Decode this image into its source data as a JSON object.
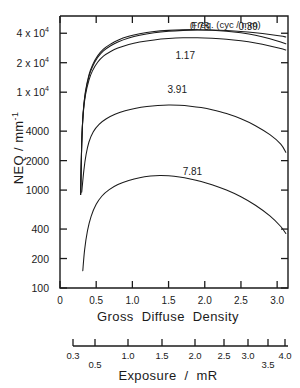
{
  "chart_data": {
    "type": "line",
    "title": "",
    "xlabel": "Gross  Diffuse  Density",
    "ylabel": "NEQ / mm⁻¹",
    "xlim": [
      0,
      3.15
    ],
    "ylim": [
      100,
      60000
    ],
    "yscale": "log",
    "grid": false,
    "legend_position": "top-right-inline",
    "legend_title": "Freq. (cyc / mm)",
    "y_ticks": [
      {
        "value": 100,
        "label": "100"
      },
      {
        "value": 200,
        "label": "200"
      },
      {
        "value": 400,
        "label": "400"
      },
      {
        "value": 1000,
        "label": "1000"
      },
      {
        "value": 2000,
        "label": "2000"
      },
      {
        "value": 4000,
        "label": "4000"
      },
      {
        "value": 10000,
        "label": "1 x 10⁴"
      },
      {
        "value": 20000,
        "label": "2 x 10⁴"
      },
      {
        "value": 40000,
        "label": "4 x 10⁴"
      }
    ],
    "x_ticks": [
      {
        "value": 0,
        "label": "0"
      },
      {
        "value": 0.5,
        "label": "0.5"
      },
      {
        "value": 1.0,
        "label": "1.0"
      },
      {
        "value": 1.5,
        "label": "1.5"
      },
      {
        "value": 2.0,
        "label": "2.0"
      },
      {
        "value": 2.5,
        "label": "2.5"
      },
      {
        "value": 3.0,
        "label": "3.0"
      }
    ],
    "secondary_axis": {
      "label": "Exposure  /  mR",
      "ticks": [
        {
          "label": "0.3",
          "px": 73,
          "row": 0
        },
        {
          "label": "0.5",
          "px": 95,
          "row": 1
        },
        {
          "label": "1.0",
          "px": 128,
          "row": 0
        },
        {
          "label": "1.5",
          "px": 162,
          "row": 0
        },
        {
          "label": "2.0",
          "px": 195,
          "row": 0
        },
        {
          "label": "2.5",
          "px": 224,
          "row": 0
        },
        {
          "label": "3.0",
          "px": 248,
          "row": 0
        },
        {
          "label": "3.5",
          "px": 268,
          "row": 1
        },
        {
          "label": "4.0",
          "px": 285,
          "row": 0
        }
      ]
    },
    "series": [
      {
        "name": "0.78",
        "label": "0.78",
        "label_x": 1.93,
        "label_y": 52000,
        "points": [
          [
            0.285,
            900
          ],
          [
            0.3,
            3000
          ],
          [
            0.32,
            6200
          ],
          [
            0.35,
            10000
          ],
          [
            0.4,
            15000
          ],
          [
            0.45,
            19000
          ],
          [
            0.52,
            23500
          ],
          [
            0.6,
            27500
          ],
          [
            0.7,
            31000
          ],
          [
            0.8,
            34000
          ],
          [
            0.95,
            37200
          ],
          [
            1.1,
            39500
          ],
          [
            1.3,
            41600
          ],
          [
            1.5,
            42800
          ],
          [
            1.7,
            43400
          ],
          [
            1.9,
            43500
          ],
          [
            2.1,
            43000
          ],
          [
            2.3,
            42000
          ],
          [
            2.5,
            40400
          ],
          [
            2.7,
            38200
          ],
          [
            2.9,
            35200
          ],
          [
            3.05,
            32600
          ],
          [
            3.12,
            31200
          ]
        ]
      },
      {
        "name": "0.39",
        "label": "0.39",
        "label_x": 2.6,
        "label_y": 52000,
        "points": [
          [
            0.285,
            900
          ],
          [
            0.3,
            3000
          ],
          [
            0.32,
            6100
          ],
          [
            0.35,
            9700
          ],
          [
            0.4,
            14500
          ],
          [
            0.45,
            18300
          ],
          [
            0.52,
            22600
          ],
          [
            0.6,
            26400
          ],
          [
            0.7,
            29800
          ],
          [
            0.8,
            32600
          ],
          [
            0.95,
            35800
          ],
          [
            1.1,
            38200
          ],
          [
            1.3,
            40400
          ],
          [
            1.5,
            41900
          ],
          [
            1.7,
            42800
          ],
          [
            1.9,
            43200
          ],
          [
            2.1,
            43100
          ],
          [
            2.3,
            42600
          ],
          [
            2.5,
            41700
          ],
          [
            2.7,
            40400
          ],
          [
            2.9,
            38800
          ],
          [
            3.05,
            37400
          ],
          [
            3.12,
            36600
          ]
        ]
      },
      {
        "name": "1.17",
        "label": "1.17",
        "label_x": 1.73,
        "label_y": 26500,
        "points": [
          [
            0.285,
            900
          ],
          [
            0.3,
            2900
          ],
          [
            0.32,
            5900
          ],
          [
            0.35,
            9200
          ],
          [
            0.4,
            13300
          ],
          [
            0.45,
            16600
          ],
          [
            0.52,
            20200
          ],
          [
            0.6,
            23300
          ],
          [
            0.7,
            26000
          ],
          [
            0.8,
            28200
          ],
          [
            0.95,
            30700
          ],
          [
            1.1,
            32500
          ],
          [
            1.3,
            34200
          ],
          [
            1.5,
            35300
          ],
          [
            1.7,
            35900
          ],
          [
            1.9,
            36000
          ],
          [
            2.1,
            35600
          ],
          [
            2.3,
            34800
          ],
          [
            2.5,
            33500
          ],
          [
            2.7,
            31800
          ],
          [
            2.9,
            29700
          ],
          [
            3.05,
            27900
          ],
          [
            3.12,
            27000
          ]
        ]
      },
      {
        "name": "3.91",
        "label": "3.91",
        "label_x": 1.62,
        "label_y": 11800,
        "points": [
          [
            0.3,
            950
          ],
          [
            0.33,
            1600
          ],
          [
            0.36,
            2300
          ],
          [
            0.4,
            3100
          ],
          [
            0.46,
            3950
          ],
          [
            0.54,
            4700
          ],
          [
            0.64,
            5350
          ],
          [
            0.76,
            5950
          ],
          [
            0.9,
            6450
          ],
          [
            1.05,
            6850
          ],
          [
            1.2,
            7130
          ],
          [
            1.35,
            7310
          ],
          [
            1.5,
            7390
          ],
          [
            1.65,
            7350
          ],
          [
            1.8,
            7200
          ],
          [
            1.95,
            6960
          ],
          [
            2.1,
            6620
          ],
          [
            2.3,
            6050
          ],
          [
            2.5,
            5350
          ],
          [
            2.7,
            4550
          ],
          [
            2.9,
            3680
          ],
          [
            3.05,
            2950
          ],
          [
            3.12,
            2430
          ]
        ]
      },
      {
        "name": "7.81",
        "label": "7.81",
        "label_x": 1.83,
        "label_y": 1720,
        "points": [
          [
            0.315,
            150
          ],
          [
            0.34,
            245
          ],
          [
            0.38,
            385
          ],
          [
            0.43,
            540
          ],
          [
            0.5,
            715
          ],
          [
            0.58,
            870
          ],
          [
            0.68,
            1010
          ],
          [
            0.8,
            1140
          ],
          [
            0.95,
            1255
          ],
          [
            1.1,
            1340
          ],
          [
            1.25,
            1390
          ],
          [
            1.38,
            1408
          ],
          [
            1.5,
            1398
          ],
          [
            1.65,
            1360
          ],
          [
            1.8,
            1300
          ],
          [
            1.95,
            1225
          ],
          [
            2.1,
            1135
          ],
          [
            2.3,
            1000
          ],
          [
            2.5,
            855
          ],
          [
            2.7,
            700
          ],
          [
            2.9,
            545
          ],
          [
            3.05,
            425
          ],
          [
            3.12,
            360
          ]
        ]
      }
    ]
  }
}
